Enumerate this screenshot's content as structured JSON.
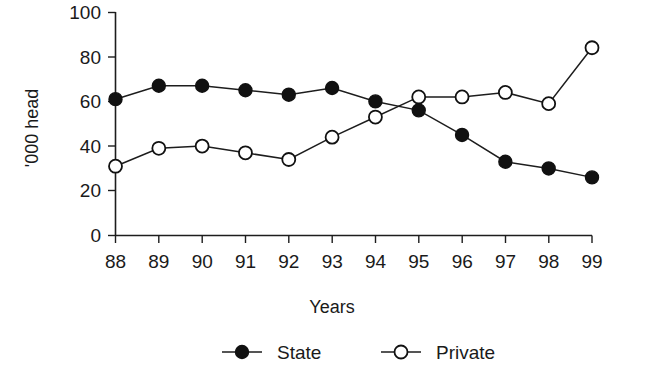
{
  "chart_data": {
    "type": "line",
    "title": "",
    "xlabel": "Years",
    "ylabel": "'000 head",
    "x": [
      "88",
      "89",
      "90",
      "91",
      "92",
      "93",
      "94",
      "95",
      "96",
      "97",
      "98",
      "99"
    ],
    "categories": [
      "88",
      "89",
      "90",
      "91",
      "92",
      "93",
      "94",
      "95",
      "96",
      "97",
      "98",
      "99"
    ],
    "series": [
      {
        "name": "State",
        "marker": "filled-circle",
        "values": [
          61,
          67,
          67,
          65,
          63,
          66,
          60,
          56,
          45,
          33,
          30,
          26
        ]
      },
      {
        "name": "Private",
        "marker": "open-circle",
        "values": [
          31,
          39,
          40,
          37,
          34,
          44,
          53,
          62,
          62,
          64,
          59,
          84
        ]
      }
    ],
    "ylim": [
      0,
      100
    ],
    "yticks": [
      0,
      20,
      40,
      60,
      80,
      100
    ],
    "ytick_labels": [
      "0",
      "20",
      "40",
      "60",
      "80",
      "100"
    ],
    "xtick_labels": [
      "88",
      "89",
      "90",
      "91",
      "92",
      "93",
      "94",
      "95",
      "96",
      "97",
      "98",
      "99"
    ],
    "grid": false,
    "legend_position": "bottom",
    "legend": [
      "State",
      "Private"
    ],
    "colors": {
      "line": "#1d1d1d",
      "state_marker_fill": "#111111",
      "private_marker_fill": "#ffffff",
      "background": "#ffffff"
    }
  },
  "axis": {
    "y_title": "'000 head",
    "x_title": "Years"
  },
  "legend": {
    "items": [
      {
        "label": "State",
        "marker": "filled-circle"
      },
      {
        "label": "Private",
        "marker": "open-circle"
      }
    ]
  }
}
